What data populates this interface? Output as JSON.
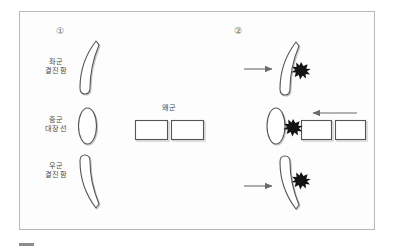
{
  "figure": {
    "kind": "naval-battle-formation-diagram",
    "frame_color": "#b9b9b9",
    "background": "#fdfdfd",
    "panels": [
      {
        "marker": "①",
        "marker_name": "panel-1-marker",
        "labels": [
          {
            "name": "left-wing",
            "line1": "좌군",
            "line2": "결진함"
          },
          {
            "name": "center-flagship",
            "line1": "중군",
            "line2": "대장선"
          },
          {
            "name": "right-wing",
            "line1": "우군",
            "line2": "결진함"
          }
        ],
        "enemy_label": "왜군",
        "enemy_ship_count": 2
      },
      {
        "marker": "②",
        "marker_name": "panel-2-marker",
        "arrow_count": 3,
        "burst_count": 3,
        "enemy_ship_count": 2
      }
    ],
    "colors": {
      "outline": "#4a4a4a",
      "arrow": "#6b6b6b",
      "burst": "#141414",
      "shadow": "#c9c9c9",
      "text": "#4a4a4a"
    },
    "bottom_dash_color": "#8d8d8d"
  }
}
